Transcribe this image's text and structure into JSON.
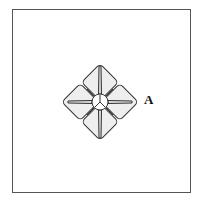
{
  "figure": {
    "label": "A",
    "colors": {
      "stroke": "#333333",
      "fill": "#eeeeee",
      "frame": "#555555"
    }
  }
}
